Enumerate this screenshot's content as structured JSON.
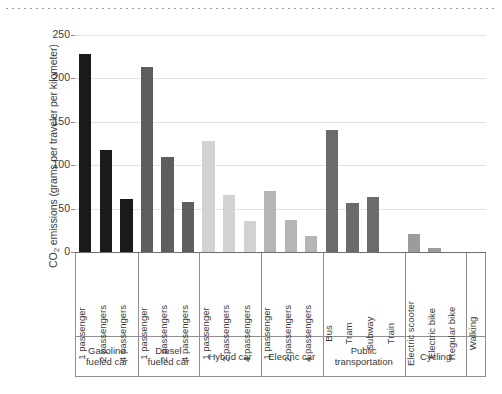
{
  "chart_data": {
    "type": "bar",
    "title": "",
    "xlabel": "",
    "ylabel": "CO2 emissions (grams per traveler per kilometer)",
    "ylabel_parts": {
      "pre": "CO",
      "sub": "2",
      "post": " emissions (grams per traveler per kilometer)"
    },
    "ylim": [
      0,
      250
    ],
    "yticks": [
      0,
      50,
      100,
      150,
      200,
      250
    ],
    "ytick_labels": [
      "0",
      "50",
      "100",
      "150",
      "200",
      "250"
    ],
    "grid": "horizontal",
    "legend": "none",
    "categories": [
      "1 passenger",
      "2 passengers",
      "4 passengers",
      "1 passenger",
      "2 passengers",
      "4 passengers",
      "1 passenger",
      "2 passengers",
      "4 passengers",
      "1 passenger",
      "2 passengers",
      "4 passengers",
      "Bus",
      "Tram",
      "Subway",
      "Train",
      "Electric scooter",
      "Electric bike",
      "Regular bike",
      "Walking"
    ],
    "values": [
      228,
      117,
      61,
      213,
      110,
      58,
      128,
      66,
      36,
      70,
      37,
      19,
      140,
      56,
      63,
      0,
      21,
      5,
      0,
      0
    ],
    "bar_colors": [
      "#1a1a1a",
      "#1a1a1a",
      "#1a1a1a",
      "#5e5e5e",
      "#5e5e5e",
      "#5e5e5e",
      "#d2d2d2",
      "#d2d2d2",
      "#d2d2d2",
      "#b5b5b5",
      "#b5b5b5",
      "#b5b5b5",
      "#6b6b6b",
      "#6b6b6b",
      "#6b6b6b",
      "#6b6b6b",
      "#9c9c9c",
      "#9c9c9c",
      "#9c9c9c",
      "#9c9c9c"
    ],
    "groups": [
      {
        "label": "Gasoline\nfueled car",
        "count": 3
      },
      {
        "label": "Diesel\nfueled car",
        "count": 3
      },
      {
        "label": "Hybrid car",
        "count": 3
      },
      {
        "label": "Electric car",
        "count": 3
      },
      {
        "label": "Public\ntransportation",
        "count": 4
      },
      {
        "label": "Cycling",
        "count": 3
      },
      {
        "label": "",
        "count": 1
      }
    ],
    "series": [
      {
        "name": "CO2 emissions",
        "values": [
          228,
          117,
          61,
          213,
          110,
          58,
          128,
          66,
          36,
          70,
          37,
          19,
          140,
          56,
          63,
          0,
          21,
          5,
          0,
          0
        ]
      }
    ]
  },
  "decor": {
    "top_rule": "dotted-rule"
  }
}
